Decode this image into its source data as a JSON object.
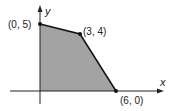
{
  "diagram": {
    "type": "feasible-region",
    "axes": {
      "x_label": "x",
      "y_label": "y"
    },
    "vertices": [
      {
        "label": "(0, 5)",
        "x": 0,
        "y": 5
      },
      {
        "label": "(3, 4)",
        "x": 3,
        "y": 4
      },
      {
        "label": "(6, 0)",
        "x": 6,
        "y": 0
      }
    ],
    "colors": {
      "region": "#a0a0a0",
      "lines": "#1a1a1a"
    }
  }
}
